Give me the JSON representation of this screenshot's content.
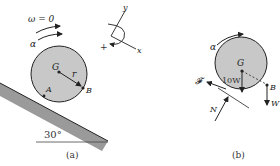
{
  "figure_a": {
    "caption": "(a)",
    "omega_label": "ω = 0",
    "alpha_label": "α",
    "center_label": "G",
    "radius_label": "r",
    "contact_label": "A",
    "point_label": "B",
    "angle_label": "30°",
    "axes": {
      "x_label": "x",
      "y_label": "y",
      "sign_label": "+"
    }
  },
  "figure_b": {
    "caption": "(b)",
    "alpha_label": "α",
    "center_label": "G",
    "weight_disk_label": "10W",
    "point_label": "B",
    "weight_point_label": "W",
    "friction_label": "𝓕",
    "normal_label": "N"
  },
  "colors": {
    "disk_fill": "#c8c8c8",
    "plank_fill": "#9a9a9a",
    "line": "#222222"
  }
}
